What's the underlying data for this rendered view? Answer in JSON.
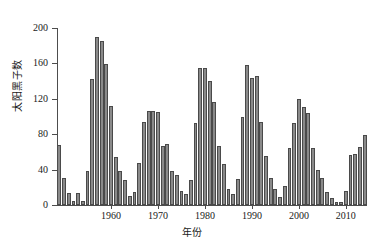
{
  "chart_data": {
    "type": "bar",
    "title": "",
    "subtitle": "",
    "xlabel": "年份",
    "ylabel": "太阳黑子数",
    "xlim": [
      1948.5,
      2014.5
    ],
    "ylim": [
      0,
      200
    ],
    "grid": false,
    "legend": null,
    "bar_color": "#8a8a8a",
    "bar_edge_color": "#4a4a4a",
    "axis_color": "#4d4d4d",
    "y_ticks": [
      0,
      40,
      80,
      120,
      160,
      200
    ],
    "x_ticks": [
      1960,
      1970,
      1980,
      1990,
      2000,
      2010
    ],
    "x": [
      1949,
      1950,
      1951,
      1952,
      1953,
      1954,
      1955,
      1956,
      1957,
      1958,
      1959,
      1960,
      1961,
      1962,
      1963,
      1964,
      1965,
      1966,
      1967,
      1968,
      1969,
      1970,
      1971,
      1972,
      1973,
      1974,
      1975,
      1976,
      1977,
      1978,
      1979,
      1980,
      1981,
      1982,
      1983,
      1984,
      1985,
      1986,
      1987,
      1988,
      1989,
      1990,
      1991,
      1992,
      1993,
      1994,
      1995,
      1996,
      1997,
      1998,
      1999,
      2000,
      2001,
      2002,
      2003,
      2004,
      2005,
      2006,
      2007,
      2008,
      2009,
      2010,
      2011,
      2012,
      2013,
      2014
    ],
    "values": [
      68,
      31,
      14,
      4,
      14,
      4,
      38,
      142,
      190,
      185,
      159,
      112,
      54,
      38,
      28,
      10,
      15,
      47,
      94,
      106,
      106,
      105,
      67,
      69,
      38,
      34,
      16,
      13,
      28,
      93,
      155,
      155,
      140,
      116,
      67,
      46,
      18,
      13,
      29,
      100,
      158,
      143,
      146,
      94,
      55,
      30,
      18,
      9,
      21,
      64,
      93,
      120,
      111,
      104,
      64,
      40,
      30,
      15,
      8,
      3,
      3,
      16,
      56,
      58,
      65,
      79
    ],
    "series": [
      {
        "name": "太阳黑子数",
        "values": [
          68,
          31,
          14,
          4,
          14,
          4,
          38,
          142,
          190,
          185,
          159,
          112,
          54,
          38,
          28,
          10,
          15,
          47,
          94,
          106,
          106,
          105,
          67,
          69,
          38,
          34,
          16,
          13,
          28,
          93,
          155,
          155,
          140,
          116,
          67,
          46,
          18,
          13,
          29,
          100,
          158,
          143,
          146,
          94,
          55,
          30,
          18,
          9,
          21,
          64,
          93,
          120,
          111,
          104,
          64,
          40,
          30,
          15,
          8,
          3,
          3,
          16,
          56,
          58,
          65,
          79
        ]
      }
    ]
  },
  "axis": {
    "y_title": "太阳黑子数",
    "x_title": "年份"
  }
}
